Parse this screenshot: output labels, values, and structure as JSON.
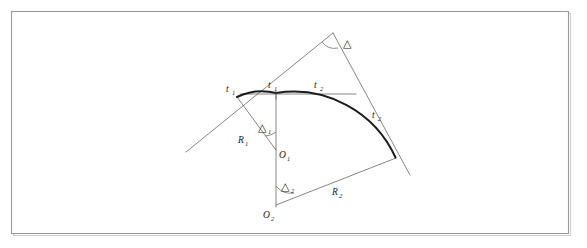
{
  "figure": {
    "kind": "compound-curve-diagram",
    "caption": "",
    "background_color": "#ffffff",
    "frame_color": "#9a9a9a",
    "line_color": "#5d5d5d",
    "curve_color": "#1c1c1c"
  },
  "labels": {
    "pc_point": {
      "base": "t",
      "sub": "1"
    },
    "tangent_first": {
      "base": "t",
      "sub": "1"
    },
    "tangent_second": {
      "base": "t",
      "sub": "2"
    },
    "tangent_right": {
      "base": "t",
      "sub": "2"
    },
    "radius_first": {
      "base": "R",
      "sub": "1"
    },
    "radius_second": {
      "base": "R",
      "sub": "2"
    },
    "center_first": {
      "base": "O",
      "sub": "1"
    },
    "center_second": {
      "base": "O",
      "sub": "2"
    },
    "delta_total": {
      "base": "△",
      "sub": ""
    },
    "delta_first": {
      "base": "△",
      "sub": "1"
    },
    "delta_second": {
      "base": "△",
      "sub": "2"
    }
  },
  "geometry": {
    "frame": {
      "x": 11,
      "y": 11,
      "width": 557,
      "height": 222
    },
    "points": {
      "pc": {
        "x": 237,
        "y": 97
      },
      "pcc": {
        "x": 276,
        "y": 93
      },
      "pt": {
        "x": 395,
        "y": 157
      },
      "pi": {
        "x": 333,
        "y": 33
      },
      "o1": {
        "x": 276,
        "y": 150
      },
      "o2": {
        "x": 276,
        "y": 205
      },
      "left_tangent_end": {
        "x": 186,
        "y": 152
      },
      "right_tangent_end": {
        "x": 410,
        "y": 175
      },
      "chord_right_end": {
        "x": 355,
        "y": 94
      }
    },
    "radii": {
      "r1": 57,
      "r2": 112
    }
  }
}
